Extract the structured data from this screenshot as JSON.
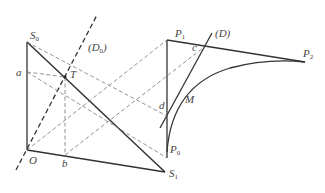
{
  "diagram": {
    "labels": {
      "S0": "S",
      "S0_sub": "0",
      "D0": "(D",
      "D0_sub": "0",
      "D0_close": ")",
      "a": "a",
      "T": "T",
      "O": "O",
      "b": "b",
      "S1": "S",
      "S1_sub": "1",
      "P1": "P",
      "P1_sub": "1",
      "D": "(D)",
      "c": "c",
      "P2": "P",
      "P2_sub": "2",
      "M": "M",
      "d": "d",
      "P0": "P",
      "P0_sub": "0"
    },
    "colors": {
      "solid": "#333333",
      "dashed": "#777777",
      "text": "#444444"
    }
  }
}
